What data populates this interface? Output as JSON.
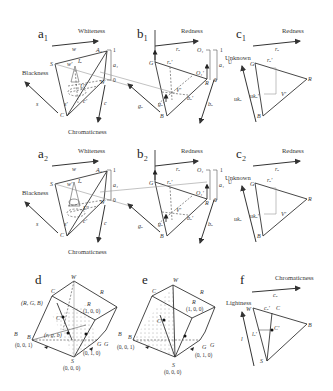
{
  "figure": {
    "panels": {
      "a1": {
        "label": "a₁",
        "top_axis": "Whiteness",
        "left_axis": "Blackness",
        "bottom_axis": "Chromaticness",
        "vectors": {
          "top": "w",
          "left": "s",
          "bottom": "c"
        },
        "vertices": {
          "S": "S",
          "C": "C",
          "W": "W",
          "A": "A₁"
        },
        "inner": {
          "w_prime": "w'",
          "s_prime": "s'",
          "c_prime": "c'",
          "U": "U'",
          "I": "Iₐ"
        },
        "scale": {
          "top": "1",
          "bottom": "0",
          "value": "a₁"
        }
      },
      "b1": {
        "label": "b₁",
        "top_axis": "Redness",
        "vectors": {
          "top": "rₒ",
          "left": "gₒ",
          "bottom": "bₒ"
        },
        "vertices": {
          "G": "G",
          "R": "R",
          "B": "B",
          "O": "O₁",
          "O_prime": "O₁'"
        },
        "inner": {
          "r_prime": "rₒ'",
          "g_prime": "gₒ'",
          "b_prime": "bₒ'",
          "V": "V'"
        },
        "scale": {
          "top": "1",
          "bottom": "0",
          "value": "a₁",
          "side": "U"
        }
      },
      "c1": {
        "label": "c₁",
        "top_axis": "Redness",
        "left_axis": "Unknown",
        "vectors": {
          "top": "rₒ",
          "left": "ukₒ"
        },
        "vertices": {
          "G": "G",
          "R": "R",
          "B": "B"
        },
        "inner": {
          "r_prime": "rₒ'",
          "uk_prime": "ukₒ'",
          "V": "V'"
        }
      },
      "a2": {
        "label": "a₂",
        "top_axis": "Whiteness",
        "left_axis": "Blackness",
        "bottom_axis": "Chromaticness",
        "vectors": {
          "top": "w",
          "left": "s",
          "bottom": "c"
        },
        "vertices": {
          "S": "S",
          "C": "C",
          "W": "W",
          "A": "A₁"
        },
        "inner": {
          "w_prime": "w'",
          "s_prime": "s'",
          "c_prime": "c'",
          "U": "U'",
          "I": "Iₐ"
        },
        "scale": {
          "top": "1",
          "bottom": "0",
          "value": "a₁"
        }
      },
      "b2": {
        "label": "b₂",
        "top_axis": "Redness",
        "vectors": {
          "top": "rₒ",
          "left": "gₒ",
          "bottom": "bₒ"
        },
        "vertices": {
          "G": "G",
          "R": "R",
          "B": "B",
          "O": "O₁",
          "O_prime": "O₁'"
        },
        "inner": {
          "r_prime": "rₒ'",
          "g_prime": "gₒ'",
          "b_prime": "bₒ'",
          "V": "V'"
        },
        "scale": {
          "top": "1",
          "bottom": "0",
          "value": "a₁",
          "side": "U"
        }
      },
      "c2": {
        "label": "c₂",
        "top_axis": "Redness",
        "left_axis": "Unknown",
        "vectors": {
          "top": "rₒ",
          "left": "ukₒ"
        },
        "vertices": {
          "G": "G",
          "R": "R",
          "B": "B"
        },
        "inner": {
          "r_prime": "rₒ'",
          "uk_prime": "ukₒ'",
          "V": "V'"
        }
      },
      "d": {
        "label": "d",
        "vertices": {
          "W": "W",
          "R": "R",
          "R_coord": "(1, 0, 0)",
          "B": "B",
          "B_coord": "(0, 0, 1)",
          "G": "G",
          "G_coord": "(0, 1, 0)",
          "S": "S",
          "S_coord": "(0, 0, 0)",
          "RGB": "(R, G, B)",
          "rgb": "(r, g, b)",
          "C_prime": "C'"
        },
        "vectors": {
          "C": "C⃗",
          "R": "R⃗",
          "B": "B⃗",
          "G": "G⃗"
        }
      },
      "e": {
        "label": "e",
        "vertices": {
          "W": "W",
          "R": "R",
          "R_coord": "(1, 0, 0)",
          "B": "B",
          "B_coord": "(0, 0, 1)",
          "G": "G",
          "G_coord": "(0, 1, 0)",
          "S": "S",
          "S_coord": "(0, 0, 0)",
          "C_prime": "C'"
        },
        "vectors": {
          "C": "C⃗",
          "R": "R⃗",
          "B": "B⃗",
          "G": "G⃗"
        }
      },
      "f": {
        "label": "f",
        "top_axis": "Chromaticness",
        "left_axis": "Lightness",
        "vectors": {
          "top": "cₒ",
          "left": "l"
        },
        "vertices": {
          "W": "W",
          "B": "B",
          "S": "S",
          "C_prime": "C'"
        },
        "inner": {
          "c_prime": "cₒ'",
          "l_prime": "lₒ'",
          "C": "C⃗"
        }
      }
    }
  }
}
